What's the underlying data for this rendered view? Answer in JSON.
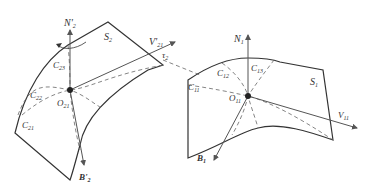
{
  "diagram": {
    "colors": {
      "stroke": "#333333",
      "dashed": "#666666",
      "axis": "#555555",
      "background": "#ffffff"
    },
    "left_surface": {
      "surface_label": "S",
      "surface_sub": "2",
      "normal_label": "N'",
      "normal_sub": "2",
      "velocity_label": "V'",
      "velocity_sub": "21",
      "binormal_label": "B'",
      "binormal_sub": "2",
      "origin_label": "O",
      "origin_sub": "21",
      "angle_label": "τ",
      "angle_sub": "2",
      "curves": [
        {
          "label": "C",
          "sub": "23"
        },
        {
          "label": "C",
          "sub": "22"
        },
        {
          "label": "C",
          "sub": "21"
        }
      ]
    },
    "right_surface": {
      "surface_label": "S",
      "surface_sub": "1",
      "normal_label": "N",
      "normal_sub": "1",
      "velocity_label": "V",
      "velocity_sub": "11",
      "binormal_label": "B",
      "binormal_sub": "1",
      "origin_label": "O",
      "origin_sub": "11",
      "curves": [
        {
          "label": "C",
          "sub": "11"
        },
        {
          "label": "C",
          "sub": "12"
        },
        {
          "label": "C",
          "sub": "13"
        }
      ]
    }
  }
}
